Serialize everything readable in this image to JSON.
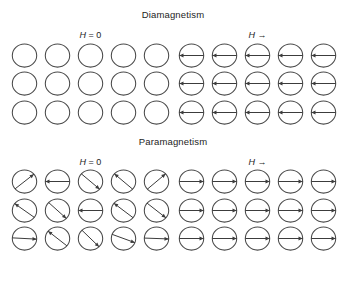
{
  "figure": {
    "background": "#ffffff",
    "ink": "#3c3c3c",
    "ring_color": "#4a4a4a"
  },
  "sections": [
    {
      "id": "diamagnetism",
      "title": "Diamagnetism",
      "panels": [
        {
          "id": "dia-zero-field",
          "label_symbol": "H",
          "label_rest": " = 0",
          "label_full": "H = 0",
          "columns": 5,
          "rows": 3,
          "moment_state": "none",
          "cells": [
            {
              "angle": null
            },
            {
              "angle": null
            },
            {
              "angle": null
            },
            {
              "angle": null
            },
            {
              "angle": null
            },
            {
              "angle": null
            },
            {
              "angle": null
            },
            {
              "angle": null
            },
            {
              "angle": null
            },
            {
              "angle": null
            },
            {
              "angle": null
            },
            {
              "angle": null
            },
            {
              "angle": null
            },
            {
              "angle": null
            },
            {
              "angle": null
            }
          ]
        },
        {
          "id": "dia-applied-field",
          "label_symbol": "H",
          "label_rest": " →",
          "label_full": "H →",
          "columns": 5,
          "rows": 3,
          "moment_state": "anti-aligned",
          "cells": [
            {
              "angle": 180
            },
            {
              "angle": 180
            },
            {
              "angle": 180
            },
            {
              "angle": 180
            },
            {
              "angle": 180
            },
            {
              "angle": 180
            },
            {
              "angle": 180
            },
            {
              "angle": 180
            },
            {
              "angle": 180
            },
            {
              "angle": 180
            },
            {
              "angle": 180
            },
            {
              "angle": 180
            },
            {
              "angle": 180
            },
            {
              "angle": 180
            },
            {
              "angle": 180
            }
          ]
        }
      ]
    },
    {
      "id": "paramagnetism",
      "title": "Paramagnetism",
      "panels": [
        {
          "id": "para-zero-field",
          "label_symbol": "H",
          "label_rest": " = 0",
          "label_full": "H = 0",
          "columns": 5,
          "rows": 3,
          "moment_state": "random",
          "cells": [
            {
              "angle": -38
            },
            {
              "angle": 180
            },
            {
              "angle": 40
            },
            {
              "angle": -140
            },
            {
              "angle": -40
            },
            {
              "angle": -145
            },
            {
              "angle": 42
            },
            {
              "angle": 180
            },
            {
              "angle": -143
            },
            {
              "angle": 38
            },
            {
              "angle": 3
            },
            {
              "angle": -142
            },
            {
              "angle": 44
            },
            {
              "angle": 20
            },
            {
              "angle": 2
            }
          ]
        },
        {
          "id": "para-applied-field",
          "label_symbol": "H",
          "label_rest": " →",
          "label_full": "H →",
          "columns": 5,
          "rows": 3,
          "moment_state": "aligned",
          "cells": [
            {
              "angle": 0
            },
            {
              "angle": 0
            },
            {
              "angle": 0
            },
            {
              "angle": 0
            },
            {
              "angle": 0
            },
            {
              "angle": 0
            },
            {
              "angle": 0
            },
            {
              "angle": 0
            },
            {
              "angle": 0
            },
            {
              "angle": 0
            },
            {
              "angle": 0
            },
            {
              "angle": 0
            },
            {
              "angle": 0
            },
            {
              "angle": 0
            },
            {
              "angle": 0
            }
          ]
        }
      ]
    }
  ]
}
